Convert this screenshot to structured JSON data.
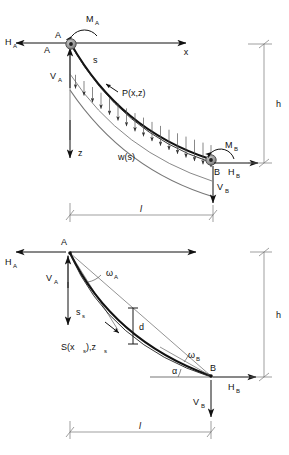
{
  "figure": {
    "colors": {
      "cable": "#111111",
      "dimension": "#777777",
      "arrow": "#111111",
      "support": "#808080",
      "background": "#ffffff"
    }
  },
  "upper_diagram": {
    "name": "free-body-diagram",
    "nodes": {
      "a_label": "A",
      "b_label": "B"
    },
    "reactions": {
      "ha": "H",
      "ha_sub": "A",
      "va": "V",
      "va_sub": "A",
      "ma": "M",
      "ma_sub": "A",
      "hb": "H",
      "hb_sub": "B",
      "vb": "V",
      "vb_sub": "B",
      "mb": "M",
      "mb_sub": "B"
    },
    "axes": {
      "x_label": "x",
      "z_label": "z"
    },
    "curve_labels": {
      "arc_length": "s",
      "point_function": "P(x,z)",
      "distributed_load": "w(s)"
    },
    "dimensions": {
      "height_label": "h",
      "span_label": "l"
    }
  },
  "lower_diagram": {
    "name": "geometry-diagram",
    "nodes": {
      "a_label": "A",
      "b_label": "B"
    },
    "reactions": {
      "ha": "H",
      "ha_sub": "A",
      "va": "V",
      "va_sub": "A",
      "hb": "H",
      "hb_sub": "B",
      "vb": "V",
      "vb_sub": "B"
    },
    "angles": {
      "omega_a": "ω",
      "omega_a_sub": "A",
      "omega_b": "ω",
      "omega_b_sub": "B",
      "alpha": "α"
    },
    "curve_labels": {
      "arc_length": "s",
      "arc_length_sub": "s",
      "point_function": "S(x",
      "point_function_sub1": "s",
      "point_function_mid": "),z",
      "point_function_sub2": "s",
      "sag": "d"
    },
    "dimensions": {
      "height_label": "h",
      "span_label": "l"
    }
  }
}
